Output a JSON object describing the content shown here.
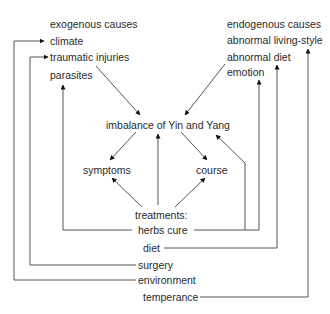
{
  "diagram": {
    "exogenous": {
      "header": "exogenous causes",
      "items": [
        "climate",
        "traumatic injuries",
        "parasites"
      ]
    },
    "endogenous": {
      "header": "endogenous causes",
      "items": [
        "abnormal living-style",
        "abnormal diet",
        "emotion"
      ]
    },
    "center": "imbalance of Yin and Yang",
    "outcomes": [
      "symptoms",
      "course"
    ],
    "treatments": {
      "header": "treatments:",
      "items": [
        "herbs cure",
        "diet",
        "surgery",
        "environment",
        "temperance"
      ]
    },
    "colors": {
      "line": "#555555",
      "text": "#2a2a2a",
      "background": "#ffffff"
    }
  }
}
